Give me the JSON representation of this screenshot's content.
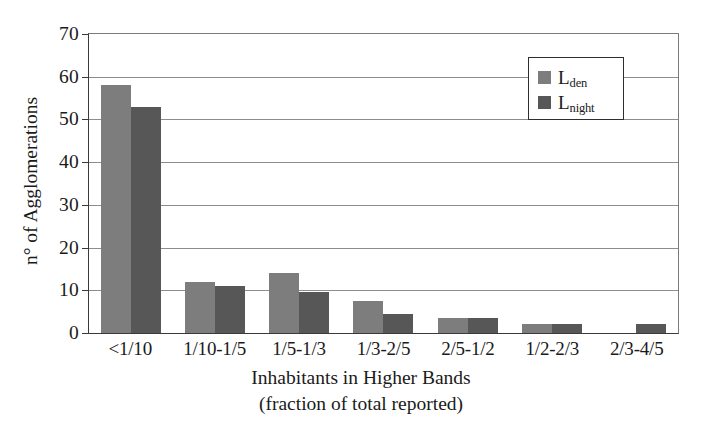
{
  "chart_data": {
    "type": "bar",
    "title": "",
    "xlabel": "Inhabitants in Higher Bands (fraction of total reported)",
    "xlabel_line1": "Inhabitants in Higher Bands",
    "xlabel_line2": "(fraction of total reported)",
    "ylabel": "n° of Agglomerations",
    "ylim": [
      0,
      70
    ],
    "ytick_values": [
      0,
      10,
      20,
      30,
      40,
      50,
      60,
      70
    ],
    "ytick_labels": [
      "0",
      "10",
      "20",
      "30",
      "40",
      "50",
      "60",
      "70"
    ],
    "grid": "horizontal",
    "legend_position": "top-right",
    "categories": [
      "<1/10",
      "1/10-1/5",
      "1/5-1/3",
      "1/3-2/5",
      "2/5-1/2",
      "1/2-2/3",
      "2/3-4/5"
    ],
    "series": [
      {
        "name": "Lden",
        "label_base": "L",
        "label_sub": "den",
        "color": "#7d7d7d",
        "values": [
          58,
          12,
          14,
          7.5,
          3.5,
          2,
          0
        ]
      },
      {
        "name": "Lnight",
        "label_base": "L",
        "label_sub": "night",
        "color": "#575757",
        "values": [
          53,
          11,
          9.5,
          4.5,
          3.5,
          2,
          2
        ]
      }
    ]
  },
  "colors": {
    "series_den": "#7d7d7d",
    "series_night": "#575757",
    "axis": "#3a3a3a",
    "grid": "#8d8d8d",
    "background": "#ffffff"
  }
}
